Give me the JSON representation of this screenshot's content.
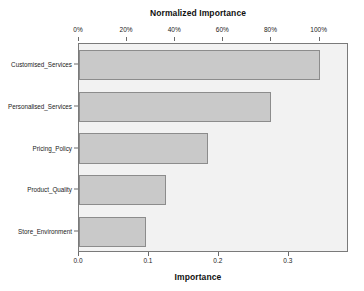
{
  "chart_data": {
    "type": "bar",
    "orientation": "horizontal",
    "title": "",
    "xlabel": "Importance",
    "ylabel": "",
    "top_axis_label": "Normalized Importance",
    "categories": [
      "Customised_Services",
      "Personalised_Services",
      "Pricing_Policy",
      "Product_Quality",
      "Store_Environment"
    ],
    "values": [
      0.344,
      0.274,
      0.184,
      0.124,
      0.096
    ],
    "normalized_values": [
      100,
      79.7,
      53.5,
      36.0,
      27.9
    ],
    "xlim": [
      0.0,
      0.386
    ],
    "x_ticks": [
      0.0,
      0.1,
      0.2,
      0.3
    ],
    "x_tick_labels": [
      "0.0",
      "0.1",
      "0.2",
      "0.3"
    ],
    "top_ticks": [
      0,
      20,
      40,
      60,
      80,
      100
    ],
    "top_tick_labels": [
      "0%",
      "20%",
      "40%",
      "60%",
      "80%",
      "100%"
    ],
    "grid": false,
    "legend": "none",
    "bar_fill_color": "#c9c9c9",
    "bar_border_color": "#8c8c8c",
    "plot_background_color": "#f2f2f2",
    "plot_border_color": "#7a7a7a"
  }
}
